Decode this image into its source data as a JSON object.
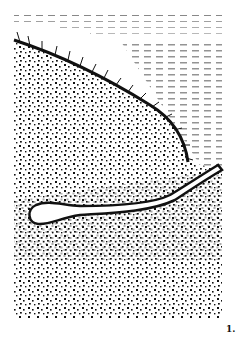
{
  "figure": {
    "label": "1.",
    "colors": {
      "ink": "#111111",
      "background": "#ffffff"
    }
  }
}
